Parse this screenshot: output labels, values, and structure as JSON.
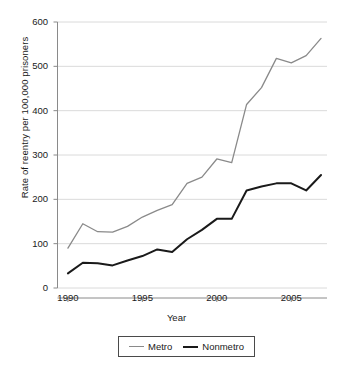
{
  "chart_data": {
    "type": "line",
    "title": "",
    "xlabel": "Year",
    "ylabel": "Rate of reentry per 100,000 prisoners",
    "x": [
      1990,
      1991,
      1992,
      1993,
      1994,
      1995,
      1996,
      1997,
      1998,
      1999,
      2000,
      2001,
      2002,
      2003,
      2004,
      2005,
      2006,
      2007
    ],
    "xlim": [
      1989.3,
      2007.4
    ],
    "ylim": [
      0,
      600
    ],
    "xticks": [
      "1990",
      "1995",
      "2000",
      "2005"
    ],
    "xtick_values": [
      1990,
      1995,
      2000,
      2005
    ],
    "yticks": [
      "0",
      "100",
      "200",
      "300",
      "400",
      "500",
      "600"
    ],
    "ytick_values": [
      0,
      100,
      200,
      300,
      400,
      500,
      600
    ],
    "grid": "horizontal",
    "legend_position": "below-axes",
    "series": [
      {
        "name": "Metro",
        "color": "#8a8a8a",
        "values": [
          90,
          145,
          127,
          126,
          139,
          160,
          175,
          188,
          236,
          250,
          291,
          283,
          414,
          452,
          518,
          508,
          524,
          563
        ]
      },
      {
        "name": "Nonmetro",
        "color": "#1a1a1a",
        "values": [
          33,
          57,
          56,
          51,
          62,
          72,
          87,
          81,
          110,
          131,
          156,
          156,
          220,
          229,
          236,
          236,
          220,
          255
        ]
      }
    ]
  }
}
